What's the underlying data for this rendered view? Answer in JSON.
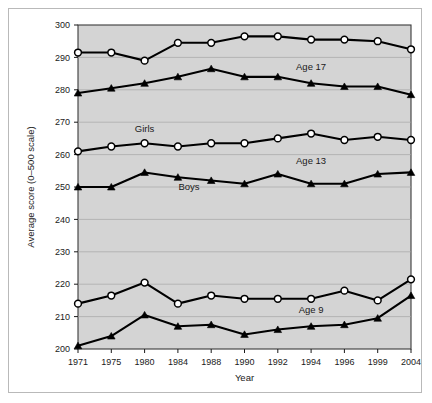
{
  "figure": {
    "background_color": "#ffffff",
    "plot_background_color": "#d4d4d4",
    "frame_color": "#b9b9b9"
  },
  "chart_data": {
    "type": "line",
    "title": "",
    "xlabel": "Year",
    "ylabel": "Average score (0–500 scale)",
    "x": [
      1971,
      1975,
      1980,
      1984,
      1988,
      1990,
      1992,
      1994,
      1996,
      1999,
      2004
    ],
    "xticklabels": [
      "1971",
      "1975",
      "1980",
      "1984",
      "1988",
      "1990",
      "1992",
      "1994",
      "1996",
      "1999",
      "2004"
    ],
    "yticklabels": [
      "200",
      "210",
      "220",
      "230",
      "240",
      "250",
      "260",
      "270",
      "280",
      "290",
      "300"
    ],
    "yticks": [
      200,
      210,
      220,
      230,
      240,
      250,
      260,
      270,
      280,
      290,
      300
    ],
    "ylim": [
      200,
      300
    ],
    "grid": "horizontal",
    "legend_position": "inline-annotations",
    "annotations": [
      {
        "text": "Age 17",
        "x": 1994,
        "y": 286
      },
      {
        "text": "Age 13",
        "x": 1994,
        "y": 257
      },
      {
        "text": "Age 9",
        "x": 1994,
        "y": 211
      },
      {
        "text": "Girls",
        "x": 1980,
        "y": 267
      },
      {
        "text": "Boys",
        "x": 1982,
        "y": 249
      }
    ],
    "series": [
      {
        "name": "Age 17 Girls",
        "group": "Age 17",
        "sex": "Girls",
        "marker": "open-circle",
        "values": [
          291.5,
          291.5,
          289.0,
          294.5,
          294.5,
          296.5,
          296.5,
          295.5,
          295.5,
          295.0,
          292.5
        ]
      },
      {
        "name": "Age 17 Boys",
        "group": "Age 17",
        "sex": "Boys",
        "marker": "filled-triangle",
        "values": [
          279.0,
          280.5,
          282.0,
          284.0,
          286.5,
          284.0,
          284.0,
          282.0,
          281.0,
          281.0,
          278.5
        ]
      },
      {
        "name": "Age 13 Girls",
        "group": "Age 13",
        "sex": "Girls",
        "marker": "open-circle",
        "values": [
          261.0,
          262.5,
          263.5,
          262.5,
          263.5,
          263.5,
          265.0,
          266.5,
          264.5,
          265.5,
          264.5
        ]
      },
      {
        "name": "Age 13 Boys",
        "group": "Age 13",
        "sex": "Boys",
        "marker": "filled-triangle",
        "values": [
          250.0,
          250.0,
          254.5,
          253.0,
          252.0,
          251.0,
          254.0,
          251.0,
          251.0,
          254.0,
          254.5
        ]
      },
      {
        "name": "Age 9 Girls",
        "group": "Age 9",
        "sex": "Girls",
        "marker": "open-circle",
        "values": [
          214.0,
          216.5,
          220.5,
          214.0,
          216.5,
          215.5,
          215.5,
          215.5,
          218.0,
          215.0,
          221.5
        ]
      },
      {
        "name": "Age 9 Boys",
        "group": "Age 9",
        "sex": "Boys",
        "marker": "filled-triangle",
        "values": [
          201.0,
          204.0,
          210.5,
          207.0,
          207.5,
          204.5,
          206.0,
          207.0,
          207.5,
          209.5,
          216.5
        ]
      }
    ]
  }
}
